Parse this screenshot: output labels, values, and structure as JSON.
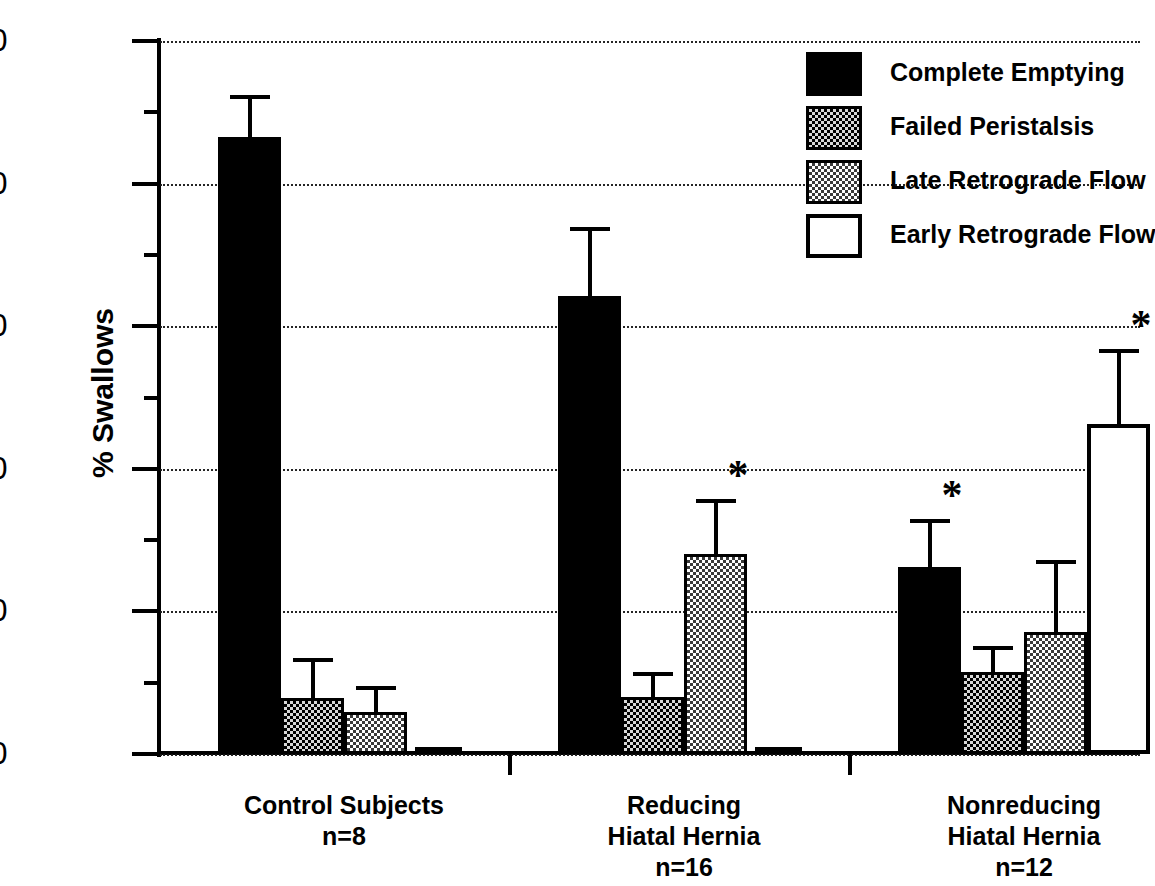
{
  "chart_data": {
    "type": "bar",
    "title": "",
    "xlabel": "",
    "ylabel": "% Swallows",
    "ylim": [
      0,
      100
    ],
    "ytick_labels": [
      "0",
      "20",
      "40",
      "60",
      "80",
      "100"
    ],
    "ytick_values": [
      0,
      20,
      40,
      60,
      80,
      100
    ],
    "yminor_values": [
      10,
      30,
      50,
      70,
      90
    ],
    "grid": "horizontal dotted at major ticks",
    "legend_position": "top-right inside",
    "categories": [
      "Control Subjects",
      "Reducing Hiatal Hernia",
      "Nonreducing Hiatal Hernia"
    ],
    "category_sublabels": [
      "n=8",
      "n=16",
      "n=12"
    ],
    "series": [
      {
        "name": "Complete Emptying",
        "pattern": "solid-black",
        "values": [
          86.5,
          64.3,
          26.2
        ],
        "errors": [
          5.6,
          9.3,
          6.5
        ],
        "significant": [
          false,
          false,
          true
        ]
      },
      {
        "name": "Failed Peristalsis",
        "pattern": "dark-dither",
        "values": [
          7.8,
          8.0,
          11.5
        ],
        "errors": [
          5.4,
          3.2,
          3.3
        ],
        "significant": [
          false,
          false,
          false
        ]
      },
      {
        "name": "Late Retrograde Flow",
        "pattern": "light-dither",
        "values": [
          5.9,
          28.1,
          17.1
        ],
        "errors": [
          3.4,
          7.4,
          9.8
        ],
        "significant": [
          false,
          true,
          false
        ]
      },
      {
        "name": "Early Retrograde Flow",
        "pattern": "open-white",
        "values": [
          0.0,
          0.0,
          46.3
        ],
        "errors": [
          0.0,
          0.0,
          10.2
        ],
        "significant": [
          false,
          false,
          true
        ]
      }
    ],
    "significance_marker": "*"
  },
  "axis": {
    "y_title": "% Swallows",
    "ticks": [
      {
        "label": "100",
        "value": 100
      },
      {
        "label": "80",
        "value": 80
      },
      {
        "label": "60",
        "value": 60
      },
      {
        "label": "40",
        "value": 40
      },
      {
        "label": "20",
        "value": 20
      },
      {
        "label": "0",
        "value": 0
      }
    ]
  },
  "legend": {
    "items": [
      {
        "label": "Complete Emptying",
        "pattern": "solid"
      },
      {
        "label": "Failed Peristalsis",
        "pattern": "dark-dither"
      },
      {
        "label": "Late Retrograde Flow",
        "pattern": "light-dither"
      },
      {
        "label": "Early Retrograde Flow",
        "pattern": "open"
      }
    ]
  },
  "groups": [
    {
      "line1": "Control Subjects",
      "line2": "",
      "n": "n=8"
    },
    {
      "line1": "Reducing",
      "line2": "Hiatal Hernia",
      "n": "n=16"
    },
    {
      "line1": "Nonreducing",
      "line2": "Hiatal Hernia",
      "n": "n=12"
    }
  ]
}
